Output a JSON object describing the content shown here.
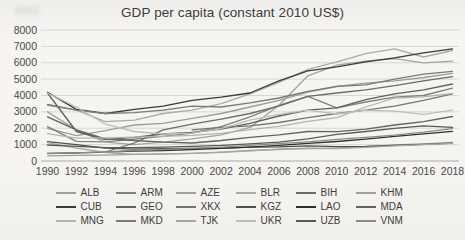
{
  "title": "GDP per capita (constant 2010 US$)",
  "chart_data": {
    "type": "line",
    "title": "GDP per capita (constant 2010 US$)",
    "xlabel": "",
    "ylabel": "",
    "x": [
      1990,
      1992,
      1994,
      1996,
      1998,
      2000,
      2002,
      2004,
      2006,
      2008,
      2010,
      2012,
      2014,
      2016,
      2018
    ],
    "y_ticks": [
      0,
      1000,
      2000,
      3000,
      4000,
      5000,
      6000,
      7000,
      8000
    ],
    "ylim": [
      0,
      8000
    ],
    "grid": "horizontal",
    "legend_position": "bottom",
    "legend_columns": 6,
    "series": [
      {
        "name": "ALB",
        "color": "#9d9d9d",
        "values": [
          2000,
          1550,
          1850,
          2200,
          2300,
          2600,
          2900,
          3300,
          3700,
          4200,
          4550,
          4750,
          4900,
          5100,
          5350
        ]
      },
      {
        "name": "ARM",
        "color": "#808080",
        "values": [
          2100,
          1200,
          1170,
          1340,
          1500,
          1700,
          2100,
          2700,
          3400,
          3950,
          3250,
          3600,
          3900,
          4000,
          4450
        ]
      },
      {
        "name": "AZE",
        "color": "#a2a2a2",
        "values": [
          3000,
          1900,
          1150,
          1000,
          1150,
          1350,
          1600,
          2050,
          3400,
          5200,
          5850,
          6100,
          6250,
          6000,
          6100
        ]
      },
      {
        "name": "BLR",
        "color": "#ababab",
        "values": [
          3400,
          3100,
          2400,
          2500,
          2900,
          3100,
          3500,
          4100,
          4800,
          5600,
          6050,
          6550,
          6850,
          6350,
          6750
        ]
      },
      {
        "name": "BIH",
        "color": "#6b6b6b",
        "values": [
          null,
          null,
          550,
          1100,
          1900,
          2250,
          2550,
          2900,
          3350,
          3950,
          4150,
          4350,
          4600,
          4900,
          5150
        ]
      },
      {
        "name": "KHM",
        "color": "#9f9f9f",
        "values": [
          320,
          340,
          360,
          400,
          420,
          470,
          530,
          620,
          720,
          780,
          790,
          880,
          980,
          1050,
          1130
        ]
      },
      {
        "name": "CUB",
        "color": "#3a3a3a",
        "values": [
          4200,
          3150,
          2900,
          3150,
          3350,
          3700,
          3900,
          4150,
          4900,
          5500,
          5750,
          6050,
          6300,
          6600,
          6850
        ]
      },
      {
        "name": "GEO",
        "color": "#5f5f5f",
        "values": [
          4150,
          1800,
          1300,
          1450,
          1650,
          1750,
          1950,
          2300,
          2750,
          3100,
          3250,
          3750,
          4100,
          4350,
          4700
        ]
      },
      {
        "name": "XKX",
        "color": "#747474",
        "values": [
          null,
          null,
          null,
          null,
          null,
          1900,
          2050,
          2150,
          2350,
          2650,
          2900,
          3100,
          3350,
          3700,
          4100
        ]
      },
      {
        "name": "KGZ",
        "color": "#4f4f4f",
        "values": [
          1180,
          1000,
          780,
          720,
          750,
          770,
          790,
          840,
          860,
          920,
          880,
          900,
          960,
          1020,
          1090
        ]
      },
      {
        "name": "LAO",
        "color": "#2f2f2f",
        "values": [
          470,
          500,
          540,
          600,
          640,
          700,
          770,
          850,
          960,
          1080,
          1190,
          1340,
          1500,
          1660,
          1810
        ]
      },
      {
        "name": "MDA",
        "color": "#636363",
        "values": [
          2700,
          1900,
          1350,
          1250,
          1150,
          1100,
          1250,
          1450,
          1600,
          1800,
          1790,
          1950,
          2200,
          2400,
          2720
        ]
      },
      {
        "name": "MNG",
        "color": "#b3b3b3",
        "values": [
          1670,
          1390,
          1410,
          1460,
          1510,
          1570,
          1690,
          1910,
          2120,
          2420,
          2650,
          3300,
          3850,
          3920,
          4120
        ]
      },
      {
        "name": "MKD",
        "color": "#7a7a7a",
        "values": [
          3450,
          3100,
          2900,
          2950,
          3100,
          3350,
          3300,
          3550,
          3850,
          4250,
          4560,
          4650,
          5000,
          5300,
          5470
        ]
      },
      {
        "name": "TJK",
        "color": "#a6a6a6",
        "values": [
          1120,
          780,
          520,
          410,
          440,
          470,
          540,
          640,
          700,
          760,
          750,
          830,
          920,
          1000,
          1080
        ]
      },
      {
        "name": "UKR",
        "color": "#bdbdbd",
        "values": [
          4150,
          3300,
          2250,
          1800,
          1650,
          1700,
          1980,
          2500,
          2850,
          3100,
          2870,
          3100,
          3050,
          2850,
          3100
        ]
      },
      {
        "name": "UZB",
        "color": "#595959",
        "values": [
          980,
          890,
          820,
          820,
          850,
          900,
          950,
          1050,
          1150,
          1350,
          1630,
          1800,
          2000,
          2150,
          2050
        ]
      },
      {
        "name": "VNM",
        "color": "#8a8a8a",
        "values": [
          450,
          500,
          560,
          640,
          700,
          770,
          850,
          950,
          1060,
          1170,
          1320,
          1450,
          1580,
          1760,
          1980
        ]
      }
    ]
  }
}
